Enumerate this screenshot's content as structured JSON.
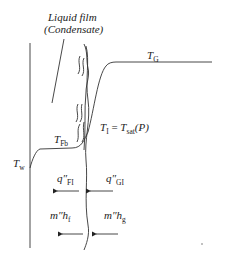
{
  "diagram": {
    "title_line1": "Liquid film",
    "title_line2": "(Condensate)",
    "labels": {
      "T_G": {
        "main": "T",
        "sub": "G"
      },
      "T_I": {
        "main": "T",
        "sub": "I",
        "eq": " = ",
        "main2": "T",
        "sub2": "sat",
        "tail": "(P)"
      },
      "T_Fb": {
        "main": "T",
        "sub": "Fb"
      },
      "T_w": {
        "main": "T",
        "sub": "w"
      },
      "q_FI": {
        "main": "q″",
        "sub": "FI"
      },
      "q_GI": {
        "main": "q″",
        "sub": "GI"
      },
      "mh_f": {
        "main": "m″h",
        "sub": "f"
      },
      "mh_g": {
        "main": "m″h",
        "sub": "g"
      }
    },
    "arrows": [
      {
        "name": "q-FI-arrow",
        "direction": "left"
      },
      {
        "name": "q-GI-arrow",
        "direction": "left"
      },
      {
        "name": "mh-f-arrow",
        "direction": "left"
      },
      {
        "name": "mh-g-arrow",
        "direction": "left"
      }
    ]
  }
}
